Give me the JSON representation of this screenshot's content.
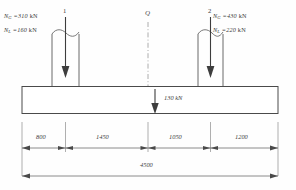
{
  "diagram": {
    "units": "kN / mm",
    "columns": [
      {
        "id": "1",
        "marker": "1",
        "loads": [
          {
            "symbol": "N",
            "subscript": "G",
            "value": "310",
            "unit": "kN",
            "text": "N_G =310 kN"
          },
          {
            "symbol": "N",
            "subscript": "L",
            "value": "160",
            "unit": "kN",
            "text": "N_L =160 kN"
          }
        ]
      },
      {
        "id": "2",
        "marker": "2",
        "loads": [
          {
            "symbol": "N",
            "subscript": "G",
            "value": "430",
            "unit": "kN",
            "text": "N_G =430 kN"
          },
          {
            "symbol": "N",
            "subscript": "L",
            "value": "220",
            "unit": "kN",
            "text": "N_L =220 kN"
          }
        ]
      }
    ],
    "centerline": {
      "label": "Q"
    },
    "beam_load": {
      "value": "130",
      "unit": "kN",
      "text": "130 kN"
    },
    "dimensions": {
      "segments": [
        {
          "label": "800"
        },
        {
          "label": "1450"
        },
        {
          "label": "1050"
        },
        {
          "label": "1200"
        }
      ],
      "total": {
        "label": "4500"
      }
    },
    "colors": {
      "line": "#555555",
      "beam_outline": "#4a4a4a",
      "dimension": "#6b6b6b",
      "centerline": "#8a8a8a",
      "text": "#3a3a3a"
    }
  }
}
